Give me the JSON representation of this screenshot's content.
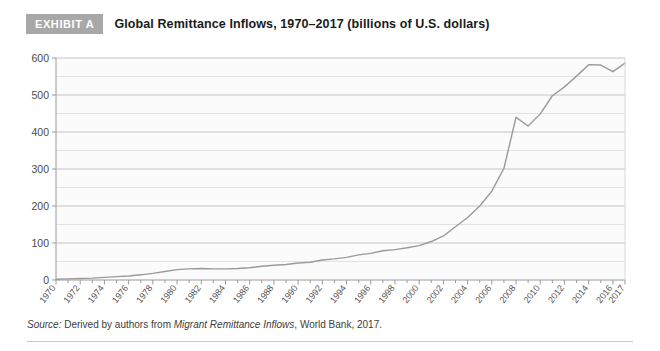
{
  "header": {
    "badge": "EXHIBIT A",
    "title": "Global Remittance Inflows, 1970–2017 (billions of U.S. dollars)"
  },
  "source": {
    "label": "Source:",
    "text_before": " Derived by authors from ",
    "work": "Migrant Remittance Inflows",
    "text_after": ", World Bank, 2017."
  },
  "colors": {
    "badge_background": "#a8a8a8",
    "badge_text": "#ffffff",
    "line": "#9a9a9a",
    "grid_major": "#c4c4c4",
    "grid_minor": "#e2e2e2",
    "axis": "#9a9a9a",
    "plot_background": "#fbfbfb",
    "title_text": "#1b1b1b"
  },
  "chart_data": {
    "type": "line",
    "title": "Global Remittance Inflows, 1970–2017 (billions of U.S. dollars)",
    "xlabel": "",
    "ylabel": "",
    "ylim": [
      0,
      600
    ],
    "xlim": [
      1970,
      2017
    ],
    "grid": true,
    "legend": false,
    "y_ticks": [
      0,
      100,
      200,
      300,
      400,
      500,
      600
    ],
    "y_tick_labels": [
      "0",
      "100",
      "200",
      "300",
      "400",
      "500",
      "600"
    ],
    "y_minor_step": 50,
    "x_ticks": [
      1970,
      1972,
      1974,
      1976,
      1978,
      1980,
      1982,
      1984,
      1986,
      1988,
      1990,
      1992,
      1994,
      1996,
      1998,
      2000,
      2002,
      2004,
      2006,
      2008,
      2010,
      2012,
      2014,
      2016,
      2017
    ],
    "x_tick_labels": [
      "1970",
      "1972",
      "1974",
      "1976",
      "1978",
      "1980",
      "1982",
      "1984",
      "1986",
      "1988",
      "1990",
      "1992",
      "1994",
      "1996",
      "1998",
      "2000",
      "2002",
      "2004",
      "2006",
      "2008",
      "2010",
      "2012",
      "2014",
      "2016",
      "2017"
    ],
    "series": [
      {
        "name": "Global remittance inflows",
        "x": [
          1970,
          1971,
          1972,
          1973,
          1974,
          1975,
          1976,
          1977,
          1978,
          1979,
          1980,
          1981,
          1982,
          1983,
          1984,
          1985,
          1986,
          1987,
          1988,
          1989,
          1990,
          1991,
          1992,
          1993,
          1994,
          1995,
          1996,
          1997,
          1998,
          1999,
          2000,
          2001,
          2002,
          2003,
          2004,
          2005,
          2006,
          2007,
          2008,
          2009,
          2010,
          2011,
          2012,
          2013,
          2014,
          2015,
          2016,
          2017
        ],
        "values": [
          2,
          3,
          4,
          5,
          7,
          9,
          11,
          14,
          18,
          23,
          28,
          30,
          31,
          30,
          30,
          31,
          33,
          37,
          40,
          42,
          46,
          48,
          54,
          57,
          61,
          68,
          72,
          79,
          82,
          87,
          93,
          104,
          119,
          144,
          169,
          200,
          240,
          302,
          440,
          416,
          449,
          498,
          522,
          551,
          582,
          581,
          563,
          586
        ]
      }
    ],
    "annotations": {
      "peak_2008": 440,
      "dip_2009": 416,
      "peak_2014": 582,
      "dip_2016": 563,
      "end_2017": 586
    }
  }
}
